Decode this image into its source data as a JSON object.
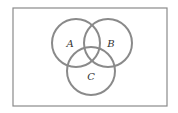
{
  "diagram": {
    "type": "venn",
    "universe": {
      "x": 13,
      "y": 8,
      "width": 154,
      "height": 98,
      "stroke": "#8a8a8a"
    },
    "circle_stroke": "#8a8a8a",
    "sets": [
      {
        "label": "A",
        "cx": 76,
        "cy": 43,
        "r": 24,
        "label_x": 70,
        "label_y": 47
      },
      {
        "label": "B",
        "cx": 108,
        "cy": 43,
        "r": 24,
        "label_x": 111,
        "label_y": 47
      },
      {
        "label": "C",
        "cx": 91,
        "cy": 71,
        "r": 24,
        "label_x": 91,
        "label_y": 80
      }
    ]
  }
}
